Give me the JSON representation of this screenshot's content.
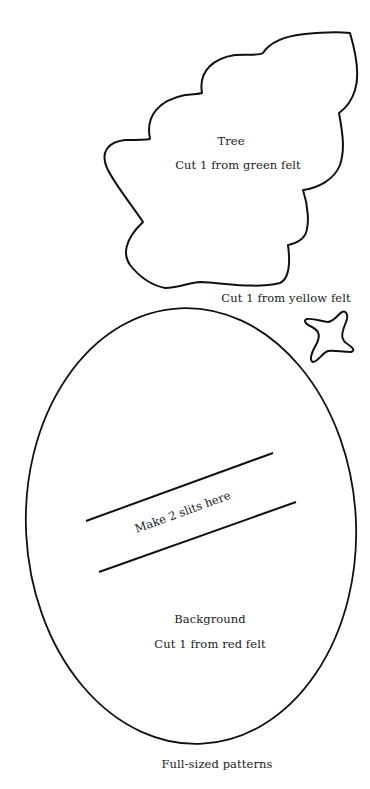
{
  "tree": {
    "title": "Tree",
    "instruction": "Cut 1 from green felt"
  },
  "star": {
    "instruction": "Cut 1 from yellow felt"
  },
  "background": {
    "slits_label": "Make 2 slits here",
    "title": "Background",
    "instruction": "Cut 1 from red felt"
  },
  "caption": "Full-sized patterns",
  "colors": {
    "line": "#111111",
    "paper": "#ffffff"
  }
}
